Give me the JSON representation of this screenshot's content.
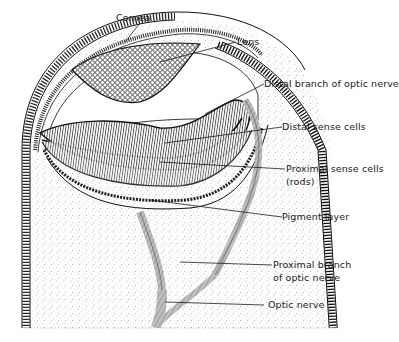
{
  "diagram": {
    "colors": {
      "ink": "#1a1a1a",
      "background": "#ffffff",
      "stipple": "#555555"
    },
    "labels": {
      "cornea": "Cornea",
      "lens": "Lens",
      "distal_branch": "Distal branch of optic nerve",
      "distal_sense_cells": "Distal sense cells",
      "proximal_sense_cells_1": "Proximal sense cells",
      "proximal_sense_cells_2": "(rods)",
      "pigment_layer": "Pigment layer",
      "proximal_branch_1": "Proximal branch",
      "proximal_branch_2": "of optic nerve",
      "optic_nerve": "Optic nerve"
    }
  }
}
